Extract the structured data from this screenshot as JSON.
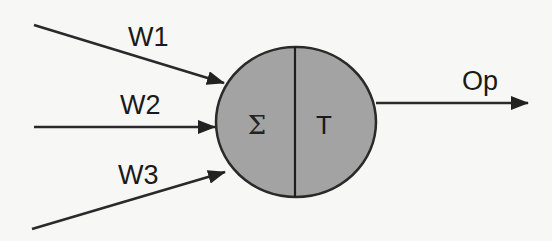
{
  "diagram": {
    "inputs": [
      {
        "label": "W1"
      },
      {
        "label": "W2"
      },
      {
        "label": "W3"
      }
    ],
    "neuron": {
      "summation_symbol": "Σ",
      "transfer_symbol": "T",
      "fill_color": "#a3a3a3",
      "stroke_color": "#2a2a2a"
    },
    "output": {
      "label": "Op"
    }
  }
}
